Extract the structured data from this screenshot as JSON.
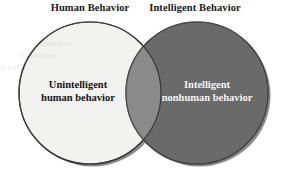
{
  "figure": {
    "type": "venn-diagram",
    "background_color": "#ffffff",
    "width": 282,
    "height": 175
  },
  "labels": {
    "left_title": "Human Behavior",
    "right_title": "Intelligent Behavior"
  },
  "sets": {
    "left": {
      "name": "Human Behavior",
      "exclusive_text_line1": "Unintelligent",
      "exclusive_text_line2": "human behavior",
      "fill_color": "#f2f2f0",
      "text_color": "#151515",
      "center_x": 90,
      "center_y": 93,
      "radius": 71
    },
    "right": {
      "name": "Intelligent Behavior",
      "exclusive_text_line1": "Intelligent",
      "exclusive_text_line2": "nonhuman behavior",
      "fill_color": "#6a6a6a",
      "text_color": "#f4f4f4",
      "center_x": 197,
      "center_y": 93,
      "radius": 71
    },
    "intersection": {
      "label": "",
      "fill_color": "#8a8a8a"
    }
  },
  "stroke": {
    "outline_color": "#3a3a3a",
    "shadow_color": "#262626"
  },
  "artifacts": {
    "ghost_line1": "scanned",
    "ghost_line2": "mirrored",
    "ghost_line3": "bleed"
  }
}
